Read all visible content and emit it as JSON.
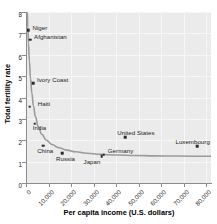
{
  "chart_data": {
    "type": "scatter",
    "title": "",
    "xlabel": "Per capita income (U.S. dollars)",
    "ylabel": "Total fertility rate",
    "xlim": [
      0,
      82000
    ],
    "ylim": [
      0,
      8
    ],
    "grid": true,
    "legend": "none",
    "xticks": [
      {
        "value": 0,
        "label": "0"
      },
      {
        "value": 10000,
        "label": "10,000"
      },
      {
        "value": 20000,
        "label": "20,000"
      },
      {
        "value": 30000,
        "label": "30,000"
      },
      {
        "value": 40000,
        "label": "40,000"
      },
      {
        "value": 50000,
        "label": "50,000"
      },
      {
        "value": 60000,
        "label": "60,000"
      },
      {
        "value": 70000,
        "label": "70,000"
      },
      {
        "value": 80000,
        "label": "80,000"
      }
    ],
    "yticks": [
      {
        "value": 0,
        "label": "0"
      },
      {
        "value": 1,
        "label": "1"
      },
      {
        "value": 2,
        "label": "2"
      },
      {
        "value": 3,
        "label": "3"
      },
      {
        "value": 4,
        "label": "4"
      },
      {
        "value": 5,
        "label": "5"
      },
      {
        "value": 6,
        "label": "6"
      },
      {
        "value": 7,
        "label": "7"
      },
      {
        "value": 8,
        "label": "8"
      }
    ],
    "points": [
      {
        "name": "Niger",
        "x": 1100,
        "y": 7.15,
        "label_dx": 4,
        "label_dy": -2.5
      },
      {
        "name": "Afghanistan",
        "x": 1800,
        "y": 6.7,
        "label_dx": 4,
        "label_dy": -2.5
      },
      {
        "name": "Ivory Coast",
        "x": 3100,
        "y": 4.68,
        "label_dx": 4,
        "label_dy": -2.5
      },
      {
        "name": "Haiti",
        "x": 1700,
        "y": 3.57,
        "label_dx": 8,
        "label_dy": -2.5
      },
      {
        "name": "India",
        "x": 3900,
        "y": 2.78,
        "label_dx": -2,
        "label_dy": 4.5
      },
      {
        "name": "China",
        "x": 7600,
        "y": 1.74,
        "label_dx": -6,
        "label_dy": 5.5
      },
      {
        "name": "Russia",
        "x": 16000,
        "y": 1.4,
        "label_dx": -6,
        "label_dy": 5.5
      },
      {
        "name": "Japan",
        "x": 33500,
        "y": 1.26,
        "label_dx": -18,
        "label_dy": 5.5
      },
      {
        "name": "Germany",
        "x": 34500,
        "y": 1.32,
        "label_dx": 4,
        "label_dy": -3.5
      },
      {
        "name": "United States",
        "x": 44000,
        "y": 2.13,
        "label_dx": -8,
        "label_dy": -4.5
      },
      {
        "name": "Luxembourg",
        "x": 76000,
        "y": 1.72,
        "label_dx": -22,
        "label_dy": -4.5
      }
    ],
    "fit_curve": {
      "description": "Decreasing exponential-style fitted curve through the data",
      "color": "#9a9a9a",
      "points": [
        {
          "x": 550,
          "y": 8.0
        },
        {
          "x": 800,
          "y": 7.3
        },
        {
          "x": 1100,
          "y": 6.55
        },
        {
          "x": 1500,
          "y": 5.7
        },
        {
          "x": 2000,
          "y": 4.9
        },
        {
          "x": 2600,
          "y": 4.2
        },
        {
          "x": 3300,
          "y": 3.6
        },
        {
          "x": 4200,
          "y": 3.1
        },
        {
          "x": 5400,
          "y": 2.65
        },
        {
          "x": 7000,
          "y": 2.28
        },
        {
          "x": 9000,
          "y": 2.0
        },
        {
          "x": 11500,
          "y": 1.8
        },
        {
          "x": 14500,
          "y": 1.65
        },
        {
          "x": 18000,
          "y": 1.54
        },
        {
          "x": 22000,
          "y": 1.46
        },
        {
          "x": 27000,
          "y": 1.39
        },
        {
          "x": 33000,
          "y": 1.34
        },
        {
          "x": 40000,
          "y": 1.31
        },
        {
          "x": 48000,
          "y": 1.29
        },
        {
          "x": 57000,
          "y": 1.27
        },
        {
          "x": 67000,
          "y": 1.26
        },
        {
          "x": 82000,
          "y": 1.25
        }
      ]
    }
  }
}
